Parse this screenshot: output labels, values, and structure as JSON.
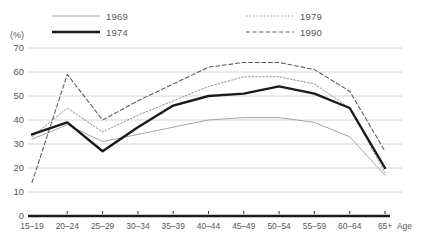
{
  "axis": {
    "unit_label": "(%)",
    "x_axis_name": "Age",
    "y_ticks": [
      "70",
      "60",
      "50",
      "40",
      "30",
      "20",
      "10",
      "0"
    ]
  },
  "legend": {
    "entries": [
      {
        "label": "1969",
        "style": "thin-solid",
        "color": "#9a9a9a"
      },
      {
        "label": "1974",
        "style": "thick-solid",
        "color": "#1a1a1a"
      },
      {
        "label": "1979",
        "style": "dotted",
        "color": "#8c8c8c"
      },
      {
        "label": "1990",
        "style": "dashed",
        "color": "#5a5a5a"
      }
    ]
  },
  "chart_data": {
    "type": "line",
    "title": "",
    "xlabel": "Age",
    "ylabel": "(%)",
    "ylim": [
      0,
      70
    ],
    "ytick_step": 10,
    "grid": true,
    "legend_position": "top",
    "categories": [
      "15–19",
      "20–24",
      "25–29",
      "30–34",
      "35–39",
      "40–44",
      "45–49",
      "50–54",
      "55–59",
      "60–64",
      "65+"
    ],
    "series": [
      {
        "name": "1969",
        "values": [
          32,
          38,
          31,
          34,
          37,
          40,
          41,
          41,
          39,
          33,
          17
        ]
      },
      {
        "name": "1974",
        "values": [
          34,
          39,
          27,
          37,
          46,
          50,
          51,
          54,
          51,
          45,
          20
        ]
      },
      {
        "name": "1979",
        "values": [
          33,
          45,
          35,
          42,
          48,
          54,
          58,
          58,
          55,
          45,
          18
        ]
      },
      {
        "name": "1990",
        "values": [
          14,
          59,
          40,
          48,
          55,
          62,
          64,
          64,
          61,
          52,
          27
        ]
      }
    ]
  }
}
